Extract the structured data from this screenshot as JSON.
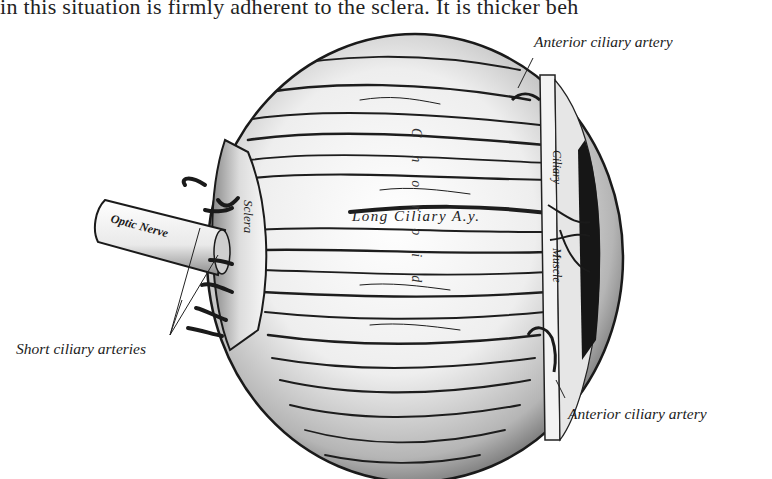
{
  "page_text_fragment": "in this situation is firmly adherent to the sclera.   It is thicker beh",
  "figure": {
    "labels": {
      "anterior_ciliary_artery_top": "Anterior ciliary artery",
      "anterior_ciliary_artery_bottom": "Anterior ciliary artery",
      "short_ciliary_arteries": "Short ciliary arteries",
      "optic_nerve": "Optic Nerve",
      "sclera": "Sclera",
      "choroid": "Choroid",
      "long_ciliary_artery": "Long  Ciliary  A.y.",
      "ciliary_muscle_1": "Ciliary",
      "ciliary_muscle_2": "Muscle"
    },
    "colors": {
      "ink": "#1a1a1a",
      "paper": "#ffffff",
      "shade": "#9a9a9a"
    }
  }
}
